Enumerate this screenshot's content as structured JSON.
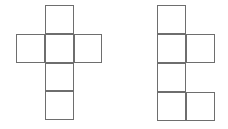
{
  "canvas": {
    "width": 228,
    "height": 129,
    "background_color": "#ffffff",
    "stroke_color": "#6e6e6e",
    "stroke_width": 1.5
  },
  "figures": [
    {
      "name": "left-cube-net",
      "shape_label": "latin-cross-hexomino",
      "origin_x": 16,
      "origin_y": 5,
      "cell_size": 28.8,
      "columns": 3,
      "rows": 4,
      "square_count": 6,
      "cells": [
        {
          "row": 1,
          "col": 2
        },
        {
          "row": 2,
          "col": 1
        },
        {
          "row": 2,
          "col": 2
        },
        {
          "row": 2,
          "col": 3
        },
        {
          "row": 3,
          "col": 2
        },
        {
          "row": 4,
          "col": 2
        }
      ]
    },
    {
      "name": "right-cube-net",
      "shape_label": "zigzag-hexomino",
      "origin_x": 157,
      "origin_y": 5,
      "cell_size": 29,
      "columns": 2,
      "rows": 4,
      "square_count": 6,
      "cells": [
        {
          "row": 1,
          "col": 1
        },
        {
          "row": 2,
          "col": 1
        },
        {
          "row": 2,
          "col": 2
        },
        {
          "row": 3,
          "col": 1
        },
        {
          "row": 4,
          "col": 1
        },
        {
          "row": 4,
          "col": 2
        }
      ]
    }
  ]
}
